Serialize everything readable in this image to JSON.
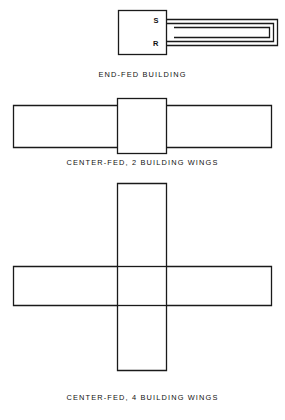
{
  "page": {
    "background_color": "#ffffff",
    "line_color": "#1a1a1a",
    "text_color": "#111111"
  },
  "figures": [
    {
      "id": "end-fed",
      "caption": "END-FED BUILDING",
      "terminals": [
        {
          "name": "send-terminal",
          "label": "S"
        },
        {
          "name": "return-terminal",
          "label": "R"
        }
      ],
      "shape": "building box with hairpin loop conductor extending to the right",
      "building_box": {
        "x": 118,
        "y": 10,
        "width": 49,
        "height": 45
      },
      "loop_extent_x": 279
    },
    {
      "id": "center-fed-2",
      "caption": "CENTER-FED, 2 BUILDING WINGS",
      "shape": "horizontal wing bar with central square core",
      "wing_bar": {
        "x": 13,
        "y": 105,
        "width": 259,
        "height": 42
      },
      "core_box": {
        "x": 117,
        "y": 98,
        "width": 50,
        "height": 55
      }
    },
    {
      "id": "center-fed-4",
      "caption": "CENTER-FED, 4 BUILDING WINGS",
      "shape": "cross of horizontal and vertical wing bars with central square core",
      "horizontal_bar": {
        "x": 13,
        "y": 266,
        "width": 259,
        "height": 39
      },
      "vertical_bar": {
        "x": 117,
        "y": 183,
        "width": 50,
        "height": 187
      },
      "core_box": {
        "x": 117,
        "y": 266,
        "width": 50,
        "height": 39
      }
    }
  ]
}
